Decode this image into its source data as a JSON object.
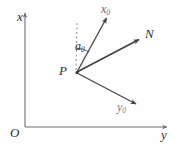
{
  "figure": {
    "kind": "coordinate-geometry-diagram",
    "background_color": "#fefefe",
    "stroke_color": "#4a4a4d",
    "axis_color": "#6e6e72",
    "dash_color": "#8e8e92",
    "text_color": "#2f2f31"
  },
  "axes": {
    "vertical": {
      "label": "x",
      "origin_px": [
        25,
        127
      ],
      "tip_px": [
        25,
        12
      ]
    },
    "horizontal": {
      "label": "y",
      "origin_px": [
        25,
        127
      ],
      "tip_px": [
        168,
        127
      ]
    },
    "origin": {
      "label": "O",
      "position_px": [
        25,
        127
      ]
    }
  },
  "points": [
    {
      "name": "point-p",
      "label": "P",
      "position_px": [
        76,
        72
      ],
      "role": "ray-origin-vertex"
    }
  ],
  "reference_line": {
    "name": "dashed-vertical-reference",
    "style": "dashed",
    "from_px": [
      76,
      72
    ],
    "to_px": [
      77,
      22
    ],
    "parallel_to": "x"
  },
  "angle": {
    "label": "a",
    "subscript": "0",
    "full_label": "α₀",
    "between": [
      "dashed-vertical-reference",
      "ray-x0"
    ],
    "arc_radius_px": 24,
    "label_position_px": [
      75,
      40
    ]
  },
  "rays": [
    {
      "name": "ray-x0",
      "label": "x",
      "subscript": "0",
      "from_px": [
        76,
        72
      ],
      "to_px": [
        108,
        14
      ],
      "arrowhead": true
    },
    {
      "name": "ray-n",
      "label": "N",
      "subscript": "",
      "from_px": [
        76,
        72
      ],
      "to_px": [
        141,
        38
      ],
      "arrowhead": true
    },
    {
      "name": "ray-y0",
      "label": "y",
      "subscript": "0",
      "from_px": [
        76,
        72
      ],
      "to_px": [
        138,
        105
      ],
      "arrowhead": true
    }
  ]
}
